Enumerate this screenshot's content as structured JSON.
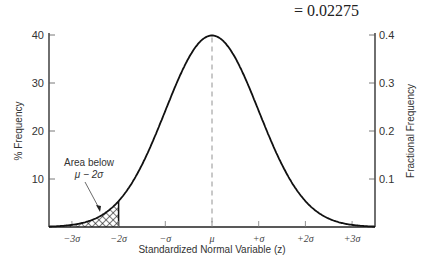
{
  "header": {
    "formula": "= 0.02275"
  },
  "chart_data": {
    "type": "line",
    "title": "",
    "xlabel": "Standardized Normal Variable (z)",
    "ylabel": "% Frequency",
    "ylabel_right": "Fractional Frequency",
    "x_tick_labels": [
      "−3σ",
      "−2σ",
      "−σ",
      "μ",
      "+σ",
      "+2σ",
      "+3σ"
    ],
    "x_ticks": [
      -3,
      -2,
      -1,
      0,
      1,
      2,
      3
    ],
    "xlim": [
      -3.5,
      3.5
    ],
    "y_left_ticks": [
      10,
      20,
      30,
      40
    ],
    "y_left_tick_labels": [
      "10",
      "20",
      "30",
      "40"
    ],
    "ylim_left": [
      0,
      40
    ],
    "y_right_ticks": [
      0.1,
      0.2,
      0.3,
      0.4
    ],
    "y_right_tick_labels": [
      "0.1",
      "0.2",
      "0.3",
      "0.4"
    ],
    "ylim_right": [
      0,
      0.4
    ],
    "series": [
      {
        "name": "Normal distribution curve",
        "x": [
          -3.5,
          -3,
          -2.5,
          -2,
          -1.5,
          -1,
          -0.5,
          0,
          0.5,
          1,
          1.5,
          2,
          2.5,
          3,
          3.5
        ],
        "values": [
          0.09,
          0.44,
          1.75,
          5.4,
          12.95,
          24.2,
          35.21,
          39.89,
          35.21,
          24.2,
          12.95,
          5.4,
          1.75,
          0.44,
          0.09
        ]
      }
    ],
    "shaded_region": {
      "from": -3.5,
      "to": -2,
      "pattern": "crosshatch",
      "label": "Area below μ − 2σ",
      "value": 0.02275
    },
    "mean_line": {
      "x": 0,
      "style": "dashed"
    },
    "annotation": {
      "line1": "Area below",
      "line2": "μ − 2σ"
    },
    "grid": false,
    "legend": "none"
  }
}
